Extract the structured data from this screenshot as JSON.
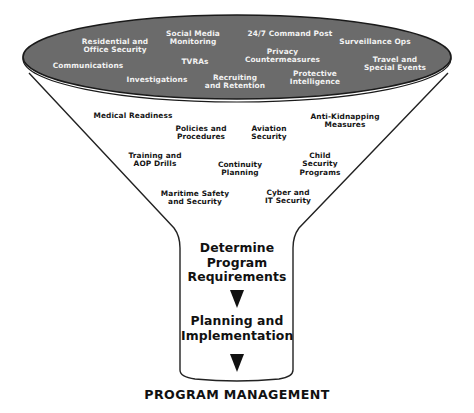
{
  "colors": {
    "rim_fill": "#6b6b6b",
    "rim_stroke": "#1a1a1a",
    "funnel_stroke": "#222222",
    "top_text": "#f2f2f2",
    "body_text": "#151515"
  },
  "funnel_top_items": [
    {
      "id": "residential",
      "label": "Residential and\nOffice Security"
    },
    {
      "id": "social-media",
      "label": "Social Media\nMonitoring"
    },
    {
      "id": "command-post",
      "label": "24/7 Command Post"
    },
    {
      "id": "surveillance",
      "label": "Surveillance Ops"
    },
    {
      "id": "communications",
      "label": "Communications"
    },
    {
      "id": "tvras",
      "label": "TVRAs"
    },
    {
      "id": "privacy",
      "label": "Privacy\nCountermeasures"
    },
    {
      "id": "travel",
      "label": "Travel and\nSpecial Events"
    },
    {
      "id": "investigations",
      "label": "Investigations"
    },
    {
      "id": "recruiting",
      "label": "Recruiting\nand Retention"
    },
    {
      "id": "protective-intel",
      "label": "Protective\nIntelligence"
    }
  ],
  "funnel_body_items": [
    {
      "id": "medical",
      "label": "Medical Readiness"
    },
    {
      "id": "policies",
      "label": "Policies and\nProcedures"
    },
    {
      "id": "aviation",
      "label": "Aviation\nSecurity"
    },
    {
      "id": "anti-kidnapping",
      "label": "Anti-Kidnapping\nMeasures"
    },
    {
      "id": "training",
      "label": "Training and\nAOP Drills"
    },
    {
      "id": "continuity",
      "label": "Continuity\nPlanning"
    },
    {
      "id": "child-security",
      "label": "Child\nSecurity\nPrograms"
    },
    {
      "id": "maritime",
      "label": "Maritime Safety\nand Security"
    },
    {
      "id": "cyber",
      "label": "Cyber and\nIT Security"
    }
  ],
  "neck_steps": [
    {
      "id": "determine",
      "label": "Determine\nProgram\nRequirements"
    },
    {
      "id": "planning",
      "label": "Planning and\nImplementation"
    }
  ],
  "arrow_icon": "down-arrowhead",
  "footer_title": "PROGRAM MANAGEMENT"
}
